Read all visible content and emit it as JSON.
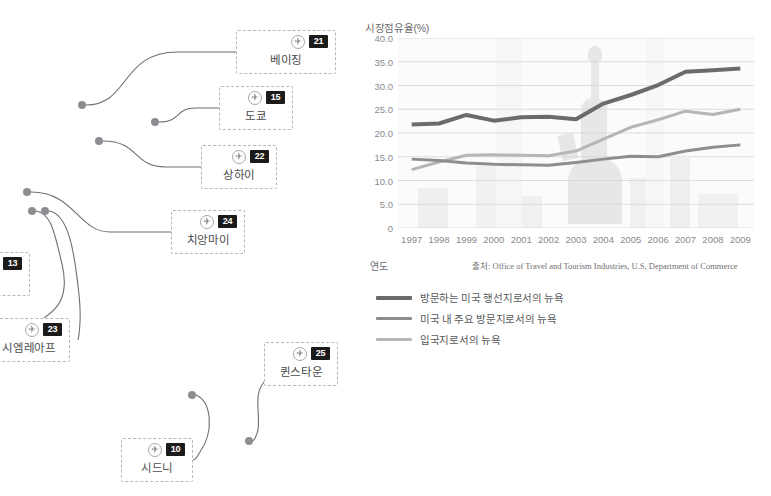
{
  "map": {
    "cards": [
      {
        "name": "베이징",
        "rank": "21",
        "icon": "airplane-icon",
        "x": 236,
        "y": 30,
        "w": 100,
        "h": 44
      },
      {
        "name": "도쿄",
        "rank": "15",
        "icon": "airplane-icon",
        "x": 219,
        "y": 86,
        "w": 74,
        "h": 44
      },
      {
        "name": "상하이",
        "rank": "22",
        "icon": "airplane-icon",
        "x": 201,
        "y": 145,
        "w": 76,
        "h": 44
      },
      {
        "name": "치앙마이",
        "rank": "24",
        "icon": "airplane-icon",
        "x": 171,
        "y": 210,
        "w": 74,
        "h": 44
      },
      {
        "name": "",
        "rank": "13",
        "icon": "airplane-icon",
        "x": -22,
        "y": 252,
        "w": 52,
        "h": 44
      },
      {
        "name": "시엠레아프",
        "rank": "23",
        "icon": "airplane-icon",
        "x": -12,
        "y": 318,
        "w": 82,
        "h": 44
      },
      {
        "name": "퀸스타운",
        "rank": "25",
        "icon": "airplane-icon",
        "x": 264,
        "y": 342,
        "w": 74,
        "h": 44
      },
      {
        "name": "시드니",
        "rank": "10",
        "icon": "airplane-icon",
        "x": 121,
        "y": 438,
        "w": 72,
        "h": 44
      }
    ],
    "dots": [
      {
        "x": 82,
        "y": 105
      },
      {
        "x": 155,
        "y": 122
      },
      {
        "x": 99,
        "y": 141
      },
      {
        "x": 27,
        "y": 192
      },
      {
        "x": 32,
        "y": 211
      },
      {
        "x": 45,
        "y": 211
      },
      {
        "x": 192,
        "y": 395
      },
      {
        "x": 249,
        "y": 441
      }
    ],
    "connectors": [
      "M 86 105 C 130 105 120 52 178 52 C 212 52 222 52 236 52",
      "M 159 122 C 182 122 174 108 196 108 C 208 108 212 108 219 108",
      "M 103 141 C 140 141 132 167 166 167 C 186 167 192 167 201 167",
      "M 31 192 C 75 192 78 232 110 232 C 140 232 152 232 171 232",
      "M 36 211 C 52 213 55 236 62 264 C 70 298 56 310 44 318",
      "M 49 211 C 68 214 74 250 78 286 C 82 316 80 330 78 340",
      "M 196 395 C 212 402 214 432 200 452 C 196 458 196 460 193 460",
      "M 253 441 C 266 426 250 398 264 382 C 268 378 270 376 272 374"
    ]
  },
  "chart": {
    "title": "시장점유율(%)",
    "axis_name": "연도",
    "source": "출처: Office of Travel and Tourism Industries, U.S, Department of Commerce",
    "legend": [
      {
        "label": "방문하는 미국 행선지로서의 뉴욕",
        "color": "#6b6b6d",
        "width": 4.0
      },
      {
        "label": "미국 내 주요 방문지로서의 뉴욕",
        "color": "#8e8e90",
        "width": 3.0
      },
      {
        "label": "입국지로서의 뉴욕",
        "color": "#b6b6b8",
        "width": 3.0
      }
    ]
  },
  "chart_data": {
    "type": "line",
    "title": "시장점유율(%)",
    "xlabel": "연도",
    "ylabel": "시장점유율(%)",
    "x": [
      "1997",
      "1998",
      "1999",
      "2000",
      "2001",
      "2002",
      "2003",
      "2004",
      "2005",
      "2006",
      "2007",
      "2008",
      "2009"
    ],
    "ylim": [
      0,
      40
    ],
    "yticks": [
      "0",
      "5.0",
      "10.0",
      "15.0",
      "20.0",
      "25.0",
      "30.0",
      "35.0",
      "40.0"
    ],
    "ytick_values": [
      0,
      5,
      10,
      15,
      20,
      25,
      30,
      35,
      40
    ],
    "grid": true,
    "legend_position": "below",
    "series": [
      {
        "name": "방문하는 미국 행선지로서의 뉴욕",
        "color": "#6b6b6d",
        "width": 4.0,
        "values": [
          21.8,
          22.0,
          23.8,
          22.6,
          23.3,
          23.4,
          22.9,
          26.2,
          28.0,
          30.1,
          32.9,
          33.2,
          33.6
        ]
      },
      {
        "name": "미국 내 주요 방문지로서의 뉴욕",
        "color": "#8e8e90",
        "width": 3.0,
        "values": [
          14.5,
          14.2,
          13.7,
          13.4,
          13.3,
          13.2,
          13.8,
          14.5,
          15.1,
          15.0,
          16.2,
          17.0,
          17.5
        ]
      },
      {
        "name": "입국지로서의 뉴욕",
        "color": "#b6b6b8",
        "width": 3.0,
        "values": [
          12.3,
          13.9,
          15.3,
          15.4,
          15.3,
          15.2,
          16.2,
          18.7,
          21.2,
          22.8,
          24.6,
          23.9,
          25.0
        ]
      }
    ]
  }
}
